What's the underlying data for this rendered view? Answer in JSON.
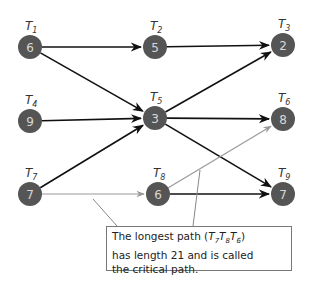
{
  "nodes": [
    {
      "id": "T1",
      "label": "T",
      "sub": "1",
      "value": "6",
      "x": 30,
      "y": 47
    },
    {
      "id": "T2",
      "label": "T",
      "sub": "2",
      "value": "5",
      "x": 155,
      "y": 47
    },
    {
      "id": "T3",
      "label": "T",
      "sub": "3",
      "value": "2",
      "x": 283,
      "y": 45
    },
    {
      "id": "T4",
      "label": "T",
      "sub": "4",
      "value": "9",
      "x": 30,
      "y": 121
    },
    {
      "id": "T5",
      "label": "T",
      "sub": "5",
      "value": "3",
      "x": 155,
      "y": 118
    },
    {
      "id": "T6",
      "label": "T",
      "sub": "6",
      "value": "8",
      "x": 283,
      "y": 119
    },
    {
      "id": "T7",
      "label": "T",
      "sub": "7",
      "value": "7",
      "x": 30,
      "y": 194
    },
    {
      "id": "T8",
      "label": "T",
      "sub": "8",
      "value": "6",
      "x": 158,
      "y": 194
    },
    {
      "id": "T9",
      "label": "T",
      "sub": "9",
      "value": "7",
      "x": 283,
      "y": 194
    }
  ],
  "edges": [
    {
      "from": "T1",
      "to": "T2",
      "critical": false
    },
    {
      "from": "T1",
      "to": "T5",
      "critical": false
    },
    {
      "from": "T2",
      "to": "T3",
      "critical": false
    },
    {
      "from": "T4",
      "to": "T5",
      "critical": false
    },
    {
      "from": "T7",
      "to": "T5",
      "critical": false
    },
    {
      "from": "T5",
      "to": "T3",
      "critical": false
    },
    {
      "from": "T5",
      "to": "T6",
      "critical": false
    },
    {
      "from": "T5",
      "to": "T9",
      "critical": false
    },
    {
      "from": "T7",
      "to": "T8",
      "critical": true
    },
    {
      "from": "T8",
      "to": "T6",
      "critical": true
    },
    {
      "from": "T8",
      "to": "T9",
      "critical": false
    }
  ],
  "callout": {
    "line1_pre": "The longest path (",
    "line1_path": [
      "7",
      "8",
      "6"
    ],
    "line1_post": ")",
    "line2": "has length 21 and is called",
    "line3": "the critical path."
  },
  "colors": {
    "node_fill": "#555555",
    "edge": "#111111",
    "critical_edge": "#999999",
    "callout_border": "#777777"
  }
}
